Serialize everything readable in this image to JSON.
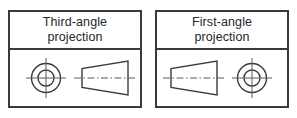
{
  "figure": {
    "kind": "engineering-drawing-projection-symbols",
    "background_color": "#ffffff",
    "line_color": "#3a3a3a",
    "text_color": "#262626"
  },
  "panels": [
    {
      "id": "third-angle",
      "title": "Third-angle\nprojection",
      "title_line1": "Third-angle",
      "title_line2": "projection",
      "symbol_order": "circle-left, cone-right",
      "left_glyph": "concentric-circles",
      "right_glyph": "truncated-cone-trapezoid"
    },
    {
      "id": "first-angle",
      "title": "First-angle\nprojection",
      "title_line1": "First-angle",
      "title_line2": "projection",
      "symbol_order": "cone-left, circle-right",
      "left_glyph": "truncated-cone-trapezoid",
      "right_glyph": "concentric-circles"
    }
  ]
}
